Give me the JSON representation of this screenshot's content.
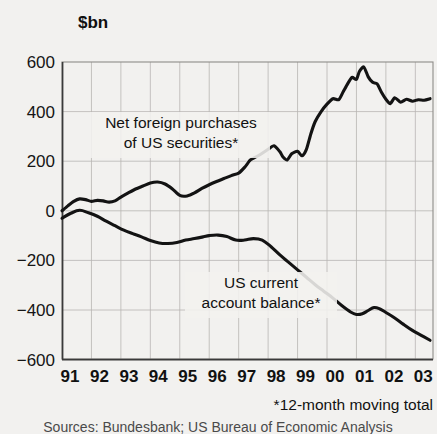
{
  "chart_data": {
    "type": "line",
    "title": "",
    "subtitle": "",
    "unit_label": "$bn",
    "xlabel": "",
    "ylabel": "$bn",
    "footnote": "*12-month moving total",
    "source": "Sources: Bundesbank; US Bureau of Economic Analysis",
    "grid": true,
    "legend_position": "inline-annotation",
    "ylim": [
      -600,
      600
    ],
    "xlim": [
      1991,
      2003.6
    ],
    "yticks": [
      "600",
      "400",
      "200",
      "0",
      "−200",
      "−400",
      "−600"
    ],
    "ytick_values": [
      600,
      400,
      200,
      0,
      -200,
      -400,
      -600
    ],
    "xticks": [
      "91",
      "92",
      "93",
      "94",
      "95",
      "96",
      "97",
      "98",
      "99",
      "00",
      "01",
      "02",
      "03"
    ],
    "xtick_values": [
      1991,
      1992,
      1993,
      1994,
      1995,
      1996,
      1997,
      1998,
      1999,
      2000,
      2001,
      2002,
      2003
    ],
    "series": [
      {
        "name": "Net foreign purchases of US securities*",
        "label_line1": "Net foreign purchases",
        "label_line2": "of US securities*",
        "color": "#131313",
        "x": [
          1991.0,
          1991.2,
          1991.4,
          1991.6,
          1991.8,
          1992.0,
          1992.2,
          1992.4,
          1992.6,
          1992.8,
          1993.0,
          1993.25,
          1993.5,
          1993.75,
          1994.0,
          1994.25,
          1994.5,
          1994.75,
          1995.0,
          1995.25,
          1995.5,
          1995.75,
          1996.0,
          1996.25,
          1996.5,
          1996.75,
          1997.0,
          1997.2,
          1997.4,
          1997.6,
          1997.8,
          1998.0,
          1998.2,
          1998.4,
          1998.5,
          1998.65,
          1998.8,
          1999.0,
          1999.15,
          1999.3,
          1999.45,
          1999.6,
          1999.8,
          2000.0,
          2000.2,
          2000.4,
          2000.55,
          2000.7,
          2000.85,
          2001.0,
          2001.1,
          2001.25,
          2001.4,
          2001.55,
          2001.7,
          2001.85,
          2002.0,
          2002.15,
          2002.3,
          2002.5,
          2002.7,
          2002.9,
          2003.1,
          2003.3,
          2003.5
        ],
        "values": [
          0,
          20,
          38,
          48,
          45,
          38,
          42,
          40,
          35,
          40,
          55,
          72,
          88,
          100,
          112,
          116,
          108,
          88,
          62,
          60,
          72,
          90,
          105,
          118,
          130,
          142,
          152,
          175,
          205,
          218,
          232,
          248,
          262,
          238,
          218,
          205,
          230,
          240,
          222,
          248,
          310,
          360,
          400,
          430,
          452,
          448,
          480,
          512,
          538,
          530,
          562,
          580,
          540,
          518,
          512,
          478,
          450,
          432,
          456,
          438,
          450,
          442,
          448,
          446,
          452
        ]
      },
      {
        "name": "US current account balance*",
        "label_line1": "US current",
        "label_line2": "account balance*",
        "color": "#131313",
        "x": [
          1991.0,
          1991.3,
          1991.6,
          1991.9,
          1992.2,
          1992.5,
          1992.8,
          1993.1,
          1993.4,
          1993.7,
          1994.0,
          1994.3,
          1994.6,
          1994.9,
          1995.2,
          1995.5,
          1995.8,
          1996.0,
          1996.3,
          1996.6,
          1996.9,
          1997.2,
          1997.5,
          1997.8,
          1998.1,
          1998.4,
          1998.7,
          1999.0,
          1999.3,
          1999.6,
          1999.9,
          2000.2,
          2000.5,
          2000.8,
          2001.0,
          2001.2,
          2001.4,
          2001.6,
          2001.8,
          2002.0,
          2002.3,
          2002.6,
          2002.9,
          2003.2,
          2003.5
        ],
        "values": [
          -30,
          -10,
          2,
          -8,
          -22,
          -42,
          -60,
          -78,
          -92,
          -105,
          -120,
          -130,
          -132,
          -128,
          -118,
          -112,
          -105,
          -100,
          -98,
          -104,
          -118,
          -118,
          -112,
          -118,
          -145,
          -178,
          -208,
          -238,
          -268,
          -298,
          -325,
          -352,
          -382,
          -408,
          -418,
          -415,
          -402,
          -390,
          -396,
          -410,
          -432,
          -458,
          -482,
          -502,
          -522
        ]
      }
    ],
    "annotations": [
      {
        "text": "*12-month moving total",
        "position": "below-axis-right"
      }
    ]
  }
}
